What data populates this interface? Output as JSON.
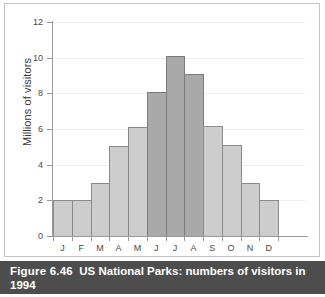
{
  "caption": {
    "number": "Figure 6.46",
    "text": "US National Parks: numbers of visitors in 1994"
  },
  "colors": {
    "bar_light": "#cdcdcd",
    "bar_dark": "#a9a9a9",
    "bar_border": "#8a8a8a",
    "axis": "#9a9a9a",
    "gridline": "#ededed",
    "caption_band": "#4d4d4d",
    "frame": "#c2c2c2"
  },
  "chart_data": {
    "type": "bar",
    "title": "US National Parks: numbers of visitors in 1994",
    "xlabel": "",
    "ylabel": "Millions of visitors",
    "categories": [
      "J",
      "F",
      "M",
      "A",
      "M",
      "J",
      "J",
      "A",
      "S",
      "O",
      "N",
      "D"
    ],
    "category_names": [
      "January",
      "February",
      "March",
      "April",
      "May",
      "June",
      "July",
      "August",
      "September",
      "October",
      "November",
      "December"
    ],
    "values": [
      2.0,
      2.0,
      3.0,
      5.05,
      6.1,
      8.1,
      10.1,
      9.1,
      6.15,
      5.1,
      3.0,
      2.0
    ],
    "ylim": [
      0,
      12
    ],
    "yticks": [
      0,
      2,
      4,
      6,
      8,
      10,
      12
    ],
    "ytick_labels": [
      "0",
      "2",
      "4",
      "6",
      "8",
      "10",
      "12"
    ],
    "grid": true,
    "legend": null,
    "bar_shades": [
      "light",
      "light",
      "light",
      "light",
      "light",
      "dark",
      "dark",
      "dark",
      "light",
      "light",
      "light",
      "light"
    ]
  }
}
